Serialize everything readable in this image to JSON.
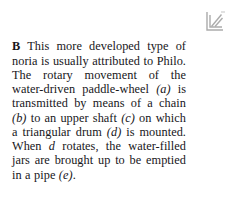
{
  "page": {
    "background_color": "#ffffff",
    "text_color": "#17161a"
  },
  "figure": {
    "icon_name": "line-drawing-fragment",
    "stroke_color": "#8c8c8c"
  },
  "caption": {
    "label": "B",
    "body_part_1": "This more developed type of noria is usually attributed to Philo. The rotary movement of the water-driven paddle-wheel ",
    "ref_a": "(a)",
    "body_part_2": " is transmitted by means of a chain ",
    "ref_b": "(b)",
    "body_part_3": " to an upper shaft ",
    "ref_c": "(c)",
    "body_part_4": " on which a triangular drum ",
    "ref_d": "(d)",
    "body_part_5": " is mounted. When ",
    "ref_d2": "d",
    "body_part_6": " rotates, the water-filled jars are brought up to be emptied in a pipe ",
    "ref_e": "(e)",
    "body_part_7": "."
  }
}
